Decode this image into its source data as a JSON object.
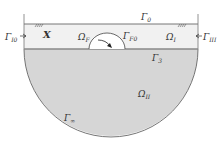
{
  "diagram": {
    "type": "domain-decomposition",
    "colors": {
      "background": "#ffffff",
      "upper_band_fill": "#f1f1f1",
      "lower_region_fill": "#d6d6d6",
      "bubble_fill": "#ffffff",
      "line": "#777777",
      "text": "#333333"
    },
    "regions": {
      "omega_F": {
        "symbol": "Ω",
        "sub": "F"
      },
      "omega_I": {
        "symbol": "Ω",
        "sub": "I"
      },
      "omega_II": {
        "symbol": "Ω",
        "sub": "II"
      }
    },
    "boundaries": {
      "gamma_0": {
        "symbol": "Γ",
        "sub": "0"
      },
      "gamma_3": {
        "symbol": "Γ",
        "sub": "3"
      },
      "gamma_F0": {
        "symbol": "Γ",
        "sub": "F0"
      },
      "gamma_I0": {
        "symbol": "Γ",
        "sub": "I0"
      },
      "gamma_III": {
        "symbol": "Γ",
        "sub": "III"
      },
      "gamma_inf": {
        "symbol": "Γ",
        "sub": "∞"
      }
    },
    "markers": {
      "point_x": "X"
    }
  }
}
